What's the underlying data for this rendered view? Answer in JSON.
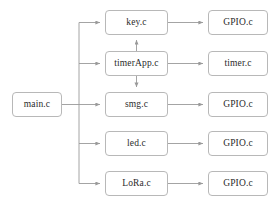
{
  "diagram": {
    "type": "flowchart",
    "background_color": "#ffffff",
    "node_border_color": "#b8b8b8",
    "node_fill_color": "#ffffff",
    "edge_color": "#9a9a9a",
    "text_color": "#2b2b2b",
    "columns": [
      {
        "name": "entry",
        "x": 12,
        "width": 50
      },
      {
        "name": "modules",
        "x": 105,
        "width": 63
      },
      {
        "name": "drivers",
        "x": 208,
        "width": 60
      }
    ],
    "nodes": [
      {
        "id": "main",
        "label": "main.c",
        "column": "entry",
        "x": 12,
        "y": 92,
        "w": 50,
        "h": 25
      },
      {
        "id": "key",
        "label": "key.c",
        "column": "modules",
        "x": 105,
        "y": 10,
        "w": 63,
        "h": 25
      },
      {
        "id": "timerapp",
        "label": "timerApp.c",
        "column": "modules",
        "x": 105,
        "y": 51,
        "w": 63,
        "h": 25
      },
      {
        "id": "smg",
        "label": "smg.c",
        "column": "modules",
        "x": 105,
        "y": 92,
        "w": 63,
        "h": 25
      },
      {
        "id": "led",
        "label": "led.c",
        "column": "modules",
        "x": 105,
        "y": 131,
        "w": 63,
        "h": 25
      },
      {
        "id": "lora",
        "label": "LoRa.c",
        "column": "modules",
        "x": 105,
        "y": 171,
        "w": 63,
        "h": 25
      },
      {
        "id": "gpio1",
        "label": "GPIO.c",
        "column": "drivers",
        "x": 208,
        "y": 10,
        "w": 60,
        "h": 25
      },
      {
        "id": "timer",
        "label": "timer.c",
        "column": "drivers",
        "x": 208,
        "y": 51,
        "w": 60,
        "h": 25
      },
      {
        "id": "gpio2",
        "label": "GPIO.c",
        "column": "drivers",
        "x": 208,
        "y": 92,
        "w": 60,
        "h": 25
      },
      {
        "id": "gpio3",
        "label": "GPIO.c",
        "column": "drivers",
        "x": 208,
        "y": 131,
        "w": 60,
        "h": 25
      },
      {
        "id": "gpio4",
        "label": "GPIO.c",
        "column": "drivers",
        "x": 208,
        "y": 171,
        "w": 60,
        "h": 25
      }
    ],
    "edges": [
      {
        "from": "main",
        "to": "key",
        "style": "orthogonal",
        "direction": "right"
      },
      {
        "from": "main",
        "to": "timerapp",
        "style": "orthogonal",
        "direction": "right"
      },
      {
        "from": "main",
        "to": "smg",
        "style": "straight",
        "direction": "right"
      },
      {
        "from": "main",
        "to": "led",
        "style": "orthogonal",
        "direction": "right"
      },
      {
        "from": "main",
        "to": "lora",
        "style": "orthogonal",
        "direction": "right"
      },
      {
        "from": "key",
        "to": "gpio1",
        "style": "straight",
        "direction": "right"
      },
      {
        "from": "timerapp",
        "to": "timer",
        "style": "straight",
        "direction": "right"
      },
      {
        "from": "smg",
        "to": "gpio2",
        "style": "straight",
        "direction": "right"
      },
      {
        "from": "led",
        "to": "gpio3",
        "style": "straight",
        "direction": "right"
      },
      {
        "from": "lora",
        "to": "gpio4",
        "style": "straight",
        "direction": "right"
      },
      {
        "from": "timerapp",
        "to": "key",
        "style": "straight",
        "direction": "up"
      },
      {
        "from": "timerapp",
        "to": "smg",
        "style": "straight",
        "direction": "down"
      }
    ]
  }
}
